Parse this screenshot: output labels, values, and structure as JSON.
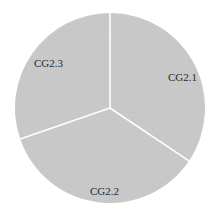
{
  "chart_data": {
    "type": "pie",
    "title": "",
    "categories": [
      "CG2.1",
      "CG2.2",
      "CG2.3"
    ],
    "values": [
      34.4,
      35.3,
      30.3
    ],
    "unit": "%",
    "start_angle_deg": 0,
    "direction": "clockwise",
    "colors": [
      "#c9c9c9",
      "#c9c9c9",
      "#c9c9c9"
    ],
    "separator_color": "#ffffff",
    "legend": "none",
    "labels_inside": true
  },
  "labels": {
    "cg21": "CG2.1",
    "cg22": "CG2.2",
    "cg23": "CG2.3"
  },
  "geometry": {
    "cx": 110,
    "cy": 108,
    "r": 95
  }
}
